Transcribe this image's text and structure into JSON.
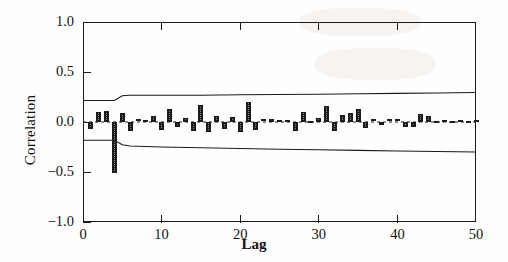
{
  "chart_data": {
    "type": "bar",
    "title": "",
    "subtitle": "",
    "xlabel": "Lag",
    "ylabel": "Correlation",
    "xlim": [
      0,
      50
    ],
    "ylim": [
      -1.0,
      1.0
    ],
    "xticks": [
      0,
      10,
      20,
      30,
      40,
      50
    ],
    "xtick_labels": [
      "0",
      "10",
      "20",
      "30",
      "40",
      "50"
    ],
    "yticks": [
      -1.0,
      -0.5,
      0.0,
      0.5,
      1.0
    ],
    "ytick_labels": [
      "-1.0",
      "-0.5",
      "0.0",
      "0.5",
      "1.0"
    ],
    "grid": false,
    "legend": null,
    "categories": [
      1,
      2,
      3,
      4,
      5,
      6,
      7,
      8,
      9,
      10,
      11,
      12,
      13,
      14,
      15,
      16,
      17,
      18,
      19,
      20,
      21,
      22,
      23,
      24,
      25,
      26,
      27,
      28,
      29,
      30,
      31,
      32,
      33,
      34,
      35,
      36,
      37,
      38,
      39,
      40,
      41,
      42,
      43,
      44,
      45,
      46,
      47,
      48,
      49,
      50
    ],
    "values": [
      -0.07,
      0.1,
      0.11,
      -0.51,
      0.09,
      -0.09,
      0.02,
      0.01,
      0.06,
      -0.08,
      0.13,
      -0.05,
      0.04,
      -0.09,
      0.17,
      -0.1,
      0.06,
      -0.07,
      0.05,
      -0.1,
      0.2,
      -0.08,
      0.02,
      0.03,
      0.01,
      0.01,
      -0.09,
      0.1,
      -0.02,
      0.04,
      0.16,
      -0.09,
      0.07,
      0.09,
      0.13,
      -0.06,
      0.02,
      -0.03,
      0.02,
      0.02,
      -0.05,
      -0.05,
      0.08,
      0.06,
      -0.02,
      0.01,
      -0.02,
      0.01,
      -0.02,
      0.01
    ],
    "series": [
      {
        "name": "Upper confidence band",
        "x": [
          0,
          4,
          5,
          6,
          10,
          15,
          20,
          25,
          30,
          35,
          40,
          45,
          50
        ],
        "values": [
          0.215,
          0.215,
          0.262,
          0.268,
          0.268,
          0.268,
          0.272,
          0.275,
          0.278,
          0.282,
          0.286,
          0.29,
          0.295
        ]
      },
      {
        "name": "Lower confidence band",
        "x": [
          0,
          4,
          5,
          6,
          10,
          15,
          20,
          25,
          30,
          35,
          40,
          45,
          50
        ],
        "values": [
          -0.182,
          -0.182,
          -0.228,
          -0.24,
          -0.25,
          -0.258,
          -0.265,
          -0.272,
          -0.278,
          -0.284,
          -0.29,
          -0.295,
          -0.3
        ]
      },
      {
        "name": "Zero reference line",
        "x": [
          0,
          50
        ],
        "values": [
          0.0,
          0.0
        ]
      }
    ],
    "colors": {
      "bar_fill": "#8a8a8a",
      "bar_stroke": "#1b1b1b",
      "band_line": "#1a1a1a",
      "axis": "#1a1a1a",
      "background": "#fefefe"
    }
  }
}
